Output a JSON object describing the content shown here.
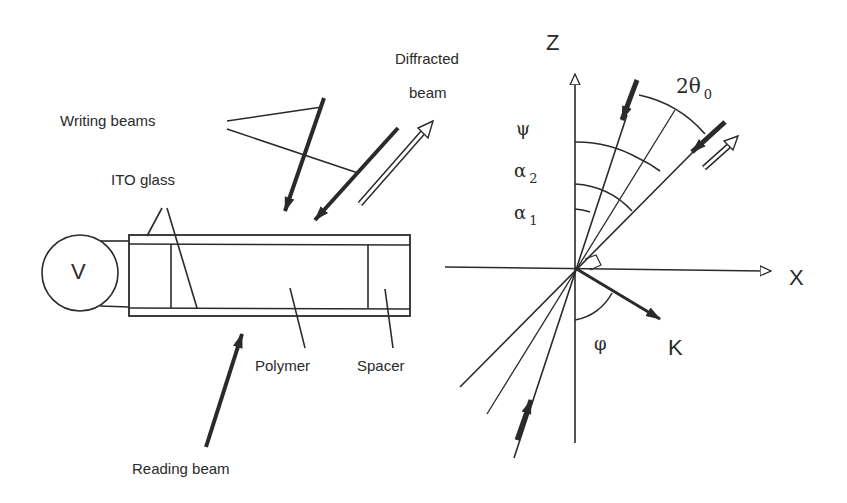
{
  "figure": {
    "left_panel": {
      "labels": {
        "diffracted_beam_line1": "Diffracted",
        "diffracted_beam_line2": "beam",
        "writing_beams": "Writing beams",
        "ito_glass": "ITO glass",
        "voltage_source": "V",
        "polymer": "Polymer",
        "spacer": "Spacer",
        "reading_beam": "Reading beam"
      }
    },
    "right_panel": {
      "axes": {
        "z": "Z",
        "x": "X"
      },
      "angles": {
        "psi": "ψ",
        "alpha2": "α",
        "alpha2_sub": "2",
        "alpha1": "α",
        "alpha1_sub": "1",
        "two_theta0": "2θ",
        "two_theta0_sub": "0",
        "phi": "φ"
      },
      "vector": {
        "k": "K"
      }
    },
    "colors": {
      "line": "#2a2a2a",
      "background": "#ffffff"
    }
  }
}
